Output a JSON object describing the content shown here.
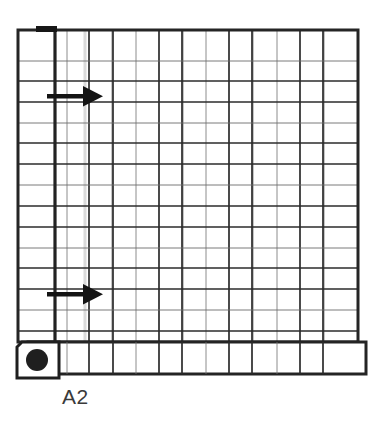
{
  "figure": {
    "kind": "technical-schematic",
    "caption": "A2",
    "background_color": "#ffffff",
    "stroke_color": "#2b2b2b",
    "thin_stroke_color": "#5a5a5a",
    "faint_stroke_color": "#c9c9c9",
    "fill_color": "#ffffff"
  },
  "grid": {
    "name": "main-grid",
    "x": 18,
    "y": 30,
    "width": 340,
    "height": 312,
    "columns": 13,
    "rows": 15,
    "major_column_count": 13,
    "major_row_count": 15,
    "outer_border_width": 3,
    "major_line_width": 1.6,
    "minor_line_width": 0.8
  },
  "left_channel": {
    "name": "left-wide-column",
    "x": 18,
    "y": 30,
    "width": 36,
    "height": 312,
    "border_width": 3
  },
  "top_marker": {
    "name": "top-black-tab",
    "x": 36,
    "y": 27,
    "width": 20,
    "height": 6,
    "color": "#1a1a1a"
  },
  "bottom_bar": {
    "name": "bottom-wide-band",
    "x": 28,
    "y": 342,
    "width": 338,
    "height": 32,
    "cells": 13,
    "border_width": 3
  },
  "node_box": {
    "name": "terminal-node-box",
    "x": 16,
    "y": 342,
    "width": 42,
    "height": 36,
    "border_width": 3
  },
  "node_dot": {
    "name": "terminal-node-dot",
    "cx": 37,
    "cy": 360,
    "r": 11,
    "color": "#1f1f1f"
  },
  "arrows": [
    {
      "name": "flow-arrow-upper",
      "label": "",
      "tail_x": 47,
      "tip_x": 101,
      "y": 96,
      "shaft_width": 4,
      "head_length": 18,
      "head_width": 20,
      "color": "#151515"
    },
    {
      "name": "flow-arrow-lower",
      "label": "",
      "tail_x": 47,
      "tip_x": 101,
      "y": 294,
      "shaft_width": 4,
      "head_length": 18,
      "head_width": 20,
      "color": "#151515"
    }
  ],
  "highlight_column": {
    "name": "faint-highlight-column",
    "x": 84,
    "width": 3,
    "color": "#d8d8d8"
  }
}
